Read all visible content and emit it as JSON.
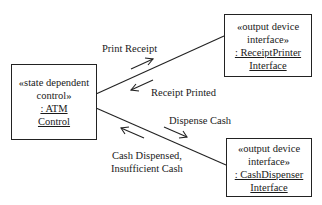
{
  "objects": {
    "atm_control": {
      "stereotype_line1": "«state dependent",
      "stereotype_line2": "control»",
      "name_line1": ": ATM",
      "name_line2": "Control"
    },
    "receipt_printer": {
      "stereotype_line1": "«output device",
      "stereotype_line2": "interface»",
      "name_line1": ": ReceiptPrinter",
      "name_line2": "Interface"
    },
    "cash_dispenser": {
      "stereotype_line1": "«output device",
      "stereotype_line2": "interface»",
      "name_line1": ": CashDispenser",
      "name_line2": "Interface"
    }
  },
  "messages": {
    "print_receipt": "Print Receipt",
    "receipt_printed": "Receipt Printed",
    "dispense_cash": "Dispense Cash",
    "cash_dispensed_line1": "Cash Dispensed,",
    "cash_dispensed_line2": "Insufficient Cash"
  }
}
